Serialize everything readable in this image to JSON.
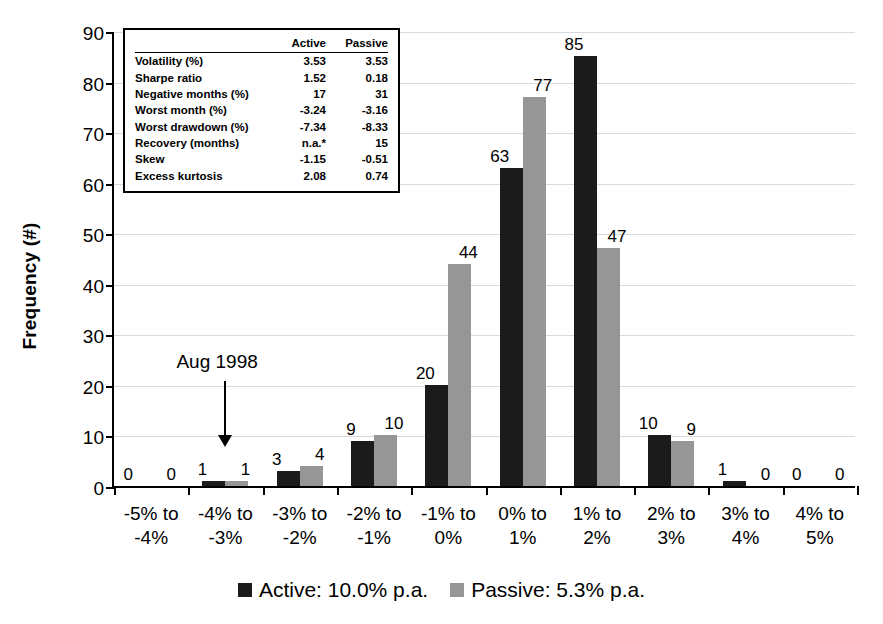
{
  "chart_data": {
    "type": "bar",
    "title": "",
    "xlabel": "",
    "ylabel": "Frequency (#)",
    "ylim": [
      0,
      90
    ],
    "ytick_step": 10,
    "yticks": [
      0,
      10,
      20,
      30,
      40,
      50,
      60,
      70,
      80,
      90
    ],
    "grid": true,
    "legend_position": "bottom",
    "categories": [
      "-5% to -4%",
      "-4% to -3%",
      "-3% to -2%",
      "-2% to -1%",
      "-1% to 0%",
      "0% to 1%",
      "1% to 2%",
      "2% to 3%",
      "3% to 4%",
      "4% to 5%"
    ],
    "category_lines": [
      [
        "-5% to",
        "-4%"
      ],
      [
        "-4% to",
        "-3%"
      ],
      [
        "-3% to",
        "-2%"
      ],
      [
        "-2% to",
        "-1%"
      ],
      [
        "-1% to",
        "0%"
      ],
      [
        "0% to",
        "1%"
      ],
      [
        "1% to",
        "2%"
      ],
      [
        "2% to",
        "3%"
      ],
      [
        "3% to",
        "4%"
      ],
      [
        "4% to",
        "5%"
      ]
    ],
    "series": [
      {
        "name": "Active: 10.0% p.a.",
        "color": "#1b1b1b",
        "values": [
          0,
          1,
          3,
          9,
          20,
          63,
          85,
          10,
          1,
          0
        ]
      },
      {
        "name": "Passive: 5.3% p.a.",
        "color": "#969696",
        "values": [
          0,
          1,
          4,
          10,
          44,
          77,
          47,
          9,
          0,
          0
        ]
      }
    ],
    "annotations": [
      {
        "text": "Aug 1998",
        "points_to_category": "-4% to -3%",
        "arrow": "down"
      }
    ]
  },
  "axis": {
    "y_title": "Frequency (#)",
    "y_ticks": [
      "0",
      "10",
      "20",
      "30",
      "40",
      "50",
      "60",
      "70",
      "80",
      "90"
    ]
  },
  "annotation": {
    "aug_1998": "Aug 1998"
  },
  "legend": {
    "items": [
      {
        "label": "Active: 10.0% p.a.",
        "color": "#1b1b1b"
      },
      {
        "label": "Passive: 5.3% p.a.",
        "color": "#969696"
      }
    ]
  },
  "stats_table": {
    "col_header_metric": "",
    "col_header_active": "Active",
    "col_header_passive": "Passive",
    "rows": [
      {
        "metric": "Volatility (%)",
        "active": "3.53",
        "passive": "3.53"
      },
      {
        "metric": "Sharpe ratio",
        "active": "1.52",
        "passive": "0.18"
      },
      {
        "metric": "Negative months (%)",
        "active": "17",
        "passive": "31"
      },
      {
        "metric": "Worst month (%)",
        "active": "-3.24",
        "passive": "-3.16"
      },
      {
        "metric": "Worst drawdown (%)",
        "active": "-7.34",
        "passive": "-8.33"
      },
      {
        "metric": "Recovery (months)",
        "active": "n.a.*",
        "passive": "15"
      },
      {
        "metric": "Skew",
        "active": "-1.15",
        "passive": "-0.51"
      },
      {
        "metric": "Excess kurtosis",
        "active": "2.08",
        "passive": "0.74"
      }
    ]
  }
}
